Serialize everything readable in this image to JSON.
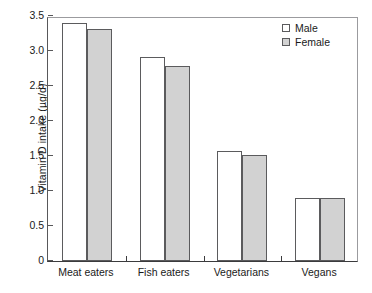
{
  "chart_data": {
    "type": "bar",
    "title": "",
    "xlabel": "",
    "ylabel": "Vitamin D intake (µg/d)",
    "categories": [
      "Meat eaters",
      "Fish eaters",
      "Vegetarians",
      "Vegans"
    ],
    "series": [
      {
        "name": "Male",
        "values": [
          3.4,
          2.91,
          1.57,
          0.9
        ],
        "color": "#ffffff"
      },
      {
        "name": "Female",
        "values": [
          3.32,
          2.79,
          1.52,
          0.9
        ],
        "color": "#d2d2d2"
      }
    ],
    "ylim": [
      0,
      3.5
    ],
    "yticks": [
      0,
      0.5,
      1.0,
      1.5,
      2.0,
      2.5,
      3.0,
      3.5
    ],
    "ytick_labels": [
      "0",
      "0.5",
      "1.0",
      "1.5",
      "2.0",
      "2.5",
      "3.0",
      "3.5"
    ],
    "grid": false,
    "legend_position": "top-right",
    "legend_entries": [
      "Male",
      "Female"
    ]
  }
}
